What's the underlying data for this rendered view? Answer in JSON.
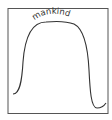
{
  "diagram": {
    "label": "mankind",
    "frame_color": "#555555",
    "curve_color": "#333333"
  }
}
